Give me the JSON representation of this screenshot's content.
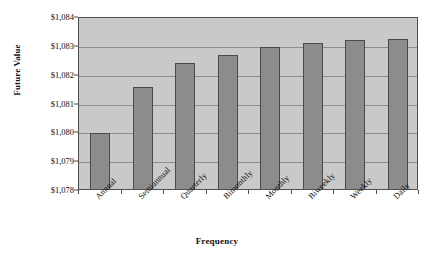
{
  "chart_data": {
    "type": "bar",
    "title": "",
    "xlabel": "Frequency",
    "ylabel": "Future Value",
    "categories": [
      "Annual",
      "Semiannual",
      "Quarterly",
      "Bimonthly",
      "Monthly",
      "Biweekly",
      "Weekly",
      "Daily"
    ],
    "values": [
      1080.0,
      1081.6,
      1082.45,
      1082.72,
      1083.0,
      1083.15,
      1083.25,
      1083.28
    ],
    "series": [
      {
        "name": "Future Value",
        "values": [
          1080.0,
          1081.6,
          1082.45,
          1082.72,
          1083.0,
          1083.15,
          1083.25,
          1083.28
        ]
      }
    ],
    "ylim": [
      1078,
      1084
    ],
    "ytick_values": [
      1078,
      1079,
      1080,
      1081,
      1082,
      1083,
      1084
    ],
    "ytick_labels": [
      "$1,078",
      "$1,079",
      "$1,080",
      "$1,081",
      "$1,082",
      "$1,083",
      "$1,084"
    ],
    "grid": true,
    "grid_axis": "y",
    "legend": false,
    "legend_position": "none",
    "bar_color": "#8c8c8c",
    "bar_border_color": "#4a4a4a",
    "plot_background": "#c9c9c9",
    "gridline_color": "#8d8d8d",
    "axis_color": "#4f4f4f",
    "figure_background": "#ffffff",
    "xtick_label_rotation": -45
  }
}
